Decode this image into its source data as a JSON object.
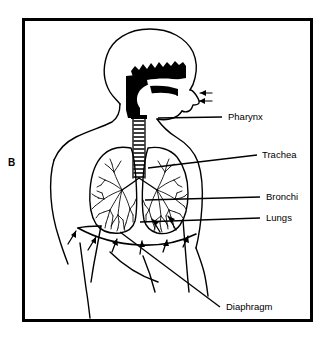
{
  "figure": {
    "panel_letter": "B",
    "title_visible": false,
    "frame": {
      "x": 22,
      "y": 18,
      "width": 291,
      "height": 304,
      "stroke": "#000000",
      "stroke_width": 3
    },
    "background_color": "#ffffff",
    "ink_color": "#000000"
  },
  "labels": [
    {
      "id": "pharynx",
      "text": "Pharynx",
      "x": 228,
      "y": 120,
      "leader": {
        "from": [
          158,
          118
        ],
        "to": [
          222,
          117
        ]
      }
    },
    {
      "id": "trachea",
      "text": "Trachea",
      "x": 262,
      "y": 158,
      "leader": {
        "from": [
          148,
          168
        ],
        "to": [
          257,
          155
        ]
      }
    },
    {
      "id": "bronchi",
      "text": "Bronchi",
      "x": 266,
      "y": 200,
      "leader": {
        "from": [
          145,
          200
        ],
        "to": [
          260,
          197
        ]
      }
    },
    {
      "id": "lungs",
      "text": "Lungs",
      "x": 266,
      "y": 221,
      "leader": {
        "from": [
          140,
          222
        ],
        "to": [
          260,
          218
        ]
      }
    },
    {
      "id": "diaphragm",
      "text": "Diaphragm",
      "x": 226,
      "y": 310,
      "leader": {
        "from": [
          120,
          232
        ],
        "to": [
          220,
          307
        ]
      }
    }
  ],
  "anatomy_parts": [
    {
      "id": "head-profile",
      "name": "head-outline",
      "interactable": false
    },
    {
      "id": "nasal-cavity",
      "name": "nasal-pharynx-cavity",
      "fill": "#000000",
      "interactable": false
    },
    {
      "id": "nose",
      "name": "nose-profile",
      "interactable": false
    },
    {
      "id": "airflow-arrows",
      "name": "airflow-arrows",
      "count": 2,
      "direction": "into-nose",
      "interactable": false
    },
    {
      "id": "trachea-tube",
      "name": "trachea-segments",
      "rings": 13,
      "interactable": false
    },
    {
      "id": "lung-left",
      "name": "lung-left",
      "interactable": false
    },
    {
      "id": "lung-right",
      "name": "lung-right",
      "interactable": false
    },
    {
      "id": "bronchial-tree",
      "name": "bronchial-tree",
      "interactable": false
    },
    {
      "id": "diaphragm-line",
      "name": "diaphragm-curve",
      "interactable": false
    },
    {
      "id": "diaphragm-arrows",
      "name": "diaphragm-motion-arrows",
      "count": 6,
      "direction": "upward",
      "interactable": false
    },
    {
      "id": "torso",
      "name": "torso-outline",
      "interactable": false
    },
    {
      "id": "arm-left",
      "name": "arm-left-outline",
      "interactable": false
    },
    {
      "id": "arm-right",
      "name": "arm-right-outline",
      "interactable": false
    }
  ]
}
